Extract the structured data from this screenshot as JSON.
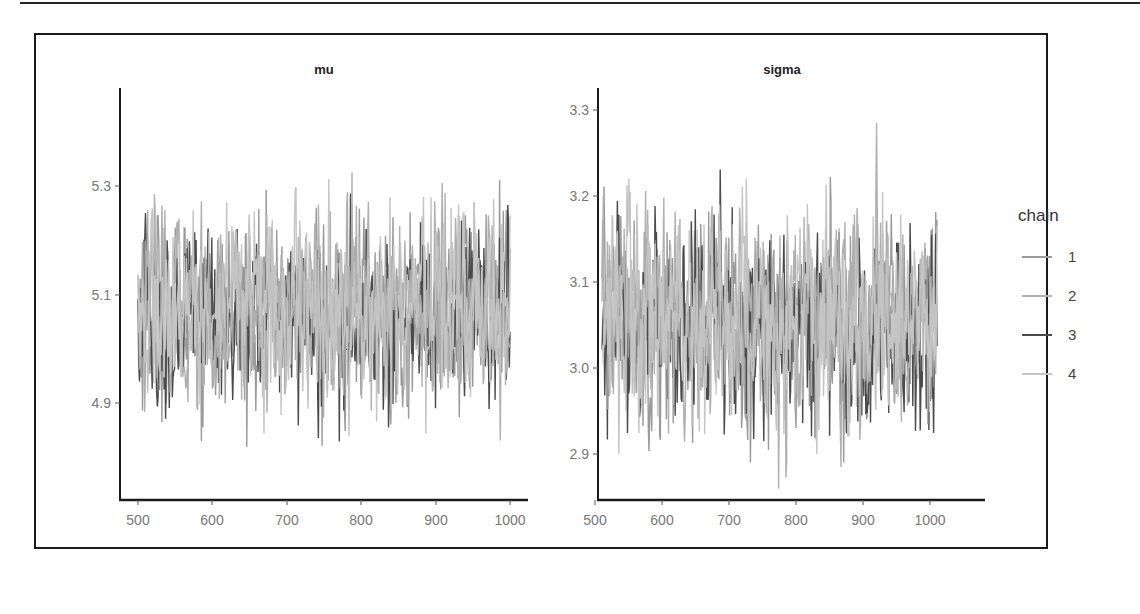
{
  "chart_data": [
    {
      "type": "line",
      "panel": "mu",
      "title": "mu",
      "xlabel": "",
      "ylabel": "",
      "x_ticks": [
        500,
        600,
        700,
        800,
        900,
        1000
      ],
      "y_ticks": [
        4.9,
        5.1,
        5.3
      ],
      "xlim": [
        480,
        1020
      ],
      "ylim": [
        4.78,
        5.47
      ],
      "grid": false,
      "description": "MCMC trace plot of 4 chains over iterations 501-1000; values oscillate around ~5.07, mostly between 4.88 and 5.28, max spike ~5.45 near iteration 930, min ~4.80 near iteration 590",
      "series_summary": [
        {
          "name": "1",
          "mean": 5.07,
          "min": 4.82,
          "max": 5.33
        },
        {
          "name": "2",
          "mean": 5.07,
          "min": 4.8,
          "max": 5.45
        },
        {
          "name": "3",
          "mean": 5.06,
          "min": 4.83,
          "max": 5.32
        },
        {
          "name": "4",
          "mean": 5.07,
          "min": 4.84,
          "max": 5.37
        }
      ]
    },
    {
      "type": "line",
      "panel": "sigma",
      "title": "sigma",
      "xlabel": "",
      "ylabel": "",
      "x_ticks": [
        500,
        600,
        700,
        800,
        900,
        1000
      ],
      "y_ticks": [
        2.9,
        3.0,
        3.1,
        3.2,
        3.3
      ],
      "xlim": [
        480,
        1020
      ],
      "ylim": [
        2.85,
        3.33
      ],
      "grid": false,
      "description": "MCMC trace plot of 4 chains over iterations 501-1000; values oscillate around ~3.06, mostly between 2.93 and 3.20, max spike ~3.30 near iteration 585, min ~2.86 near iteration 655",
      "series_summary": [
        {
          "name": "1",
          "mean": 3.06,
          "min": 2.89,
          "max": 3.27
        },
        {
          "name": "2",
          "mean": 3.06,
          "min": 2.86,
          "max": 3.3
        },
        {
          "name": "3",
          "mean": 3.05,
          "min": 2.88,
          "max": 3.25
        },
        {
          "name": "4",
          "mean": 3.06,
          "min": 2.9,
          "max": 3.22
        }
      ]
    }
  ],
  "panels": {
    "mu": {
      "title": "mu",
      "y_tick_labels": [
        "5.3",
        "5.1",
        "4.9"
      ],
      "x_tick_labels": [
        "500",
        "600",
        "700",
        "800",
        "900",
        "1000"
      ]
    },
    "sigma": {
      "title": "sigma",
      "y_tick_labels": [
        "3.3",
        "3.2",
        "3.1",
        "3.0",
        "2.9"
      ],
      "x_tick_labels": [
        "500",
        "600",
        "700",
        "800",
        "900",
        "1000"
      ]
    }
  },
  "legend": {
    "title": "chain",
    "position": "right",
    "items": [
      {
        "label": "1",
        "color": "#9a9a9a"
      },
      {
        "label": "2",
        "color": "#b0b0b0"
      },
      {
        "label": "3",
        "color": "#4a4a4a"
      },
      {
        "label": "4",
        "color": "#c4c4c4"
      }
    ]
  }
}
